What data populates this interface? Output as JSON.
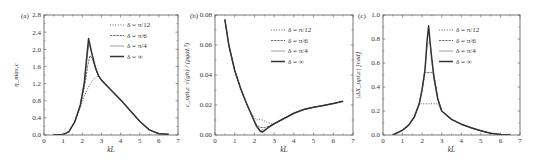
{
  "figure": {
    "panels": [
      "a",
      "b",
      "c"
    ]
  },
  "chart_data": [
    {
      "type": "line",
      "panel_label": "(a)",
      "title": "",
      "xlabel": "kL",
      "ylabel": "η_max,c",
      "xlim": [
        0,
        7
      ],
      "ylim": [
        0,
        2.8
      ],
      "xticks": [
        "0",
        "1",
        "2",
        "3",
        "4",
        "5",
        "6",
        "7"
      ],
      "yticks": [
        "0.0",
        "0.4",
        "0.8",
        "1.2",
        "1.6",
        "2.0",
        "2.4",
        "2.8"
      ],
      "legend_position": "upper right",
      "grid": false,
      "series": [
        {
          "name": "δ = π/12",
          "style": "dotted",
          "x": [
            0.5,
            1.0,
            1.3,
            1.6,
            1.9,
            2.1,
            2.3,
            2.5,
            2.7,
            2.85,
            3.0,
            3.5,
            4.0,
            4.5,
            5.0,
            5.5,
            6.0,
            6.5
          ],
          "y": [
            0.0,
            0.01,
            0.08,
            0.3,
            0.65,
            0.9,
            1.1,
            1.25,
            1.34,
            1.38,
            1.28,
            1.05,
            0.82,
            0.57,
            0.32,
            0.12,
            0.03,
            0.02
          ]
        },
        {
          "name": "δ = π/6",
          "style": "dashed",
          "x": [
            0.5,
            1.0,
            1.3,
            1.6,
            1.9,
            2.1,
            2.3,
            2.4,
            2.5,
            2.7,
            2.85,
            3.0,
            3.5,
            4.0,
            4.5,
            5.0,
            5.5,
            6.0,
            6.5
          ],
          "y": [
            0.0,
            0.01,
            0.08,
            0.3,
            0.7,
            1.1,
            1.65,
            1.85,
            1.8,
            1.55,
            1.38,
            1.28,
            1.05,
            0.82,
            0.57,
            0.32,
            0.12,
            0.03,
            0.02
          ]
        },
        {
          "name": "δ = π/4",
          "style": "thin",
          "x": [
            0.5,
            1.0,
            1.3,
            1.6,
            1.9,
            2.1,
            2.25,
            2.35,
            2.5,
            2.7,
            2.85,
            3.0,
            3.5,
            4.0,
            4.5,
            5.0,
            5.5,
            6.0,
            6.5
          ],
          "y": [
            0.0,
            0.01,
            0.08,
            0.3,
            0.7,
            1.2,
            1.8,
            2.15,
            1.9,
            1.55,
            1.38,
            1.28,
            1.05,
            0.82,
            0.57,
            0.32,
            0.12,
            0.03,
            0.02
          ]
        },
        {
          "name": "δ = ∞",
          "style": "thick",
          "x": [
            0.5,
            1.0,
            1.3,
            1.6,
            1.9,
            2.1,
            2.25,
            2.33,
            2.5,
            2.7,
            2.85,
            3.0,
            3.5,
            4.0,
            4.5,
            5.0,
            5.5,
            6.0,
            6.5
          ],
          "y": [
            0.0,
            0.01,
            0.08,
            0.3,
            0.7,
            1.2,
            1.9,
            2.25,
            1.9,
            1.55,
            1.38,
            1.28,
            1.05,
            0.82,
            0.57,
            0.32,
            0.12,
            0.03,
            0.02
          ]
        }
      ]
    },
    {
      "type": "line",
      "panel_label": "(b)",
      "title": "",
      "xlabel": "kL",
      "ylabel": "c_opt,c √(gh) / (ρgaL²)",
      "xlim": [
        0,
        7
      ],
      "ylim": [
        0,
        0.08
      ],
      "xticks": [
        "0",
        "1",
        "2",
        "3",
        "4",
        "5",
        "6",
        "7"
      ],
      "yticks": [
        "0.00",
        "0.02",
        "0.04",
        "0.06",
        "0.08"
      ],
      "legend_position": "upper right",
      "grid": false,
      "series": [
        {
          "name": "δ = π/12",
          "style": "dotted",
          "x": [
            0.5,
            0.7,
            1.0,
            1.3,
            1.6,
            1.9,
            2.1,
            2.3,
            2.5,
            2.7,
            3.0,
            3.5,
            4.0,
            4.5,
            5.0,
            5.5,
            6.0,
            6.5
          ],
          "y": [
            0.077,
            0.06,
            0.043,
            0.031,
            0.021,
            0.013,
            0.01,
            0.0105,
            0.0095,
            0.008,
            0.0075,
            0.011,
            0.0145,
            0.017,
            0.0185,
            0.0197,
            0.021,
            0.0225
          ]
        },
        {
          "name": "δ = π/6",
          "style": "dashed",
          "x": [
            0.5,
            0.7,
            1.0,
            1.3,
            1.6,
            1.9,
            2.1,
            2.3,
            2.5,
            2.7,
            3.0,
            3.5,
            4.0,
            4.5,
            5.0,
            5.5,
            6.0,
            6.5
          ],
          "y": [
            0.077,
            0.06,
            0.043,
            0.031,
            0.021,
            0.012,
            0.007,
            0.005,
            0.005,
            0.0055,
            0.0075,
            0.011,
            0.0145,
            0.017,
            0.0185,
            0.0197,
            0.021,
            0.0225
          ]
        },
        {
          "name": "δ = π/4",
          "style": "thin",
          "x": [
            0.5,
            0.7,
            1.0,
            1.3,
            1.6,
            1.9,
            2.1,
            2.3,
            2.5,
            2.7,
            3.0,
            3.5,
            4.0,
            4.5,
            5.0,
            5.5,
            6.0,
            6.5
          ],
          "y": [
            0.077,
            0.06,
            0.043,
            0.031,
            0.021,
            0.012,
            0.006,
            0.003,
            0.0035,
            0.005,
            0.0075,
            0.011,
            0.0145,
            0.017,
            0.0185,
            0.0197,
            0.021,
            0.0225
          ]
        },
        {
          "name": "δ = ∞",
          "style": "thick",
          "x": [
            0.5,
            0.7,
            1.0,
            1.3,
            1.6,
            1.9,
            2.1,
            2.3,
            2.4,
            2.5,
            2.7,
            3.0,
            3.5,
            4.0,
            4.5,
            5.0,
            5.5,
            6.0,
            6.5
          ],
          "y": [
            0.077,
            0.06,
            0.043,
            0.031,
            0.021,
            0.012,
            0.006,
            0.0025,
            0.002,
            0.0028,
            0.005,
            0.0075,
            0.011,
            0.0145,
            0.017,
            0.0185,
            0.0197,
            0.021,
            0.0225
          ]
        }
      ]
    },
    {
      "type": "line",
      "panel_label": "(c)",
      "title": "",
      "xlabel": "kL",
      "ylabel": "|ΔX_opt,c|  [rad]",
      "xlim": [
        0,
        7
      ],
      "ylim": [
        0,
        1.0
      ],
      "xticks": [
        "0",
        "1",
        "2",
        "3",
        "4",
        "5",
        "6",
        "7"
      ],
      "yticks": [
        "0.0",
        "0.2",
        "0.4",
        "0.6",
        "0.8",
        "1.0"
      ],
      "legend_position": "upper right",
      "grid": false,
      "series": [
        {
          "name": "δ = π/12",
          "style": "dotted",
          "x": [
            0.5,
            1.0,
            1.3,
            1.6,
            1.85,
            2.0,
            2.3,
            2.6,
            2.8,
            3.0,
            3.5,
            4.0,
            4.5,
            5.0,
            5.5,
            6.0,
            6.5
          ],
          "y": [
            0.0,
            0.04,
            0.08,
            0.15,
            0.26,
            0.26,
            0.26,
            0.26,
            0.26,
            0.2,
            0.13,
            0.09,
            0.06,
            0.035,
            0.015,
            0.005,
            0.0
          ]
        },
        {
          "name": "δ = π/6",
          "style": "dashed",
          "x": [
            0.5,
            1.0,
            1.3,
            1.6,
            1.85,
            2.0,
            2.15,
            2.3,
            2.5,
            2.6,
            2.8,
            3.0,
            3.5,
            4.0,
            4.5,
            5.0,
            5.5,
            6.0,
            6.5
          ],
          "y": [
            0.0,
            0.04,
            0.08,
            0.15,
            0.26,
            0.38,
            0.52,
            0.52,
            0.52,
            0.51,
            0.3,
            0.2,
            0.13,
            0.09,
            0.06,
            0.035,
            0.015,
            0.005,
            0.0
          ]
        },
        {
          "name": "δ = π/4",
          "style": "thin",
          "x": [
            0.5,
            1.0,
            1.3,
            1.6,
            1.85,
            2.0,
            2.15,
            2.25,
            2.4,
            2.5,
            2.6,
            2.8,
            3.0,
            3.5,
            4.0,
            4.5,
            5.0,
            5.5,
            6.0,
            6.5
          ],
          "y": [
            0.0,
            0.04,
            0.08,
            0.15,
            0.26,
            0.38,
            0.55,
            0.75,
            0.78,
            0.62,
            0.48,
            0.3,
            0.2,
            0.13,
            0.09,
            0.06,
            0.035,
            0.015,
            0.005,
            0.0
          ]
        },
        {
          "name": "δ = ∞",
          "style": "thick",
          "x": [
            0.5,
            1.0,
            1.3,
            1.6,
            1.85,
            2.0,
            2.15,
            2.25,
            2.33,
            2.45,
            2.6,
            2.8,
            3.0,
            3.5,
            4.0,
            4.5,
            5.0,
            5.5,
            6.0,
            6.5
          ],
          "y": [
            0.0,
            0.04,
            0.08,
            0.15,
            0.26,
            0.38,
            0.55,
            0.78,
            0.91,
            0.7,
            0.48,
            0.3,
            0.2,
            0.13,
            0.09,
            0.06,
            0.035,
            0.015,
            0.005,
            0.0
          ]
        }
      ]
    }
  ],
  "layout": {
    "panels": [
      {
        "left": 44,
        "right": 178,
        "top": 15,
        "bottom": 135,
        "legend_x": 126,
        "legend_y": 27,
        "ylabel_x": 18
      },
      {
        "left": 215,
        "right": 353,
        "top": 15,
        "bottom": 135,
        "legend_x": 287,
        "legend_y": 32,
        "ylabel_x": 189
      },
      {
        "left": 383,
        "right": 520,
        "top": 15,
        "bottom": 135,
        "legend_x": 455,
        "legend_y": 32,
        "ylabel_x": 360
      }
    ],
    "colors": {
      "axis": "#555555",
      "line": "#555555",
      "thick": "#333333",
      "text": "#333333"
    }
  }
}
